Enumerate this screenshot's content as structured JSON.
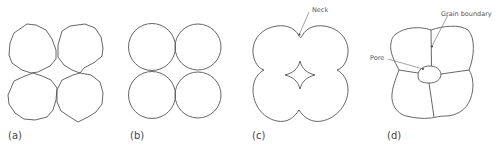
{
  "diagram": {
    "panels": [
      {
        "id": "a",
        "label": "(a)",
        "description": "Four irregular loose powder particles in contact"
      },
      {
        "id": "b",
        "label": "(b)",
        "description": "Four spherical particles touching at points"
      },
      {
        "id": "c",
        "label": "(c)",
        "description": "Particles joined with necks; star-shaped pore in centre",
        "annotations": [
          {
            "text": "Neck"
          }
        ]
      },
      {
        "id": "d",
        "label": "(d)",
        "description": "Densified grains with grain boundaries and rounded pore",
        "annotations": [
          {
            "text": "Grain boundary"
          },
          {
            "text": "Pore"
          }
        ]
      }
    ]
  },
  "colors": {
    "line": "#555555",
    "text": "#444444",
    "background": "#ffffff"
  }
}
